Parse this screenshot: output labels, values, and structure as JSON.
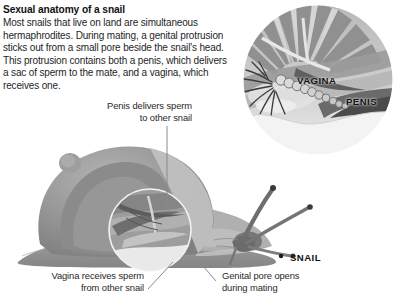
{
  "figure": {
    "title": "Sexual anatomy of a snail",
    "body": "Most snails that live on land are simultaneous hermaphrodites. During mating, a genital protrusion sticks out from a small pore beside the snail's head. This protrusion contains both a penis, which delivers a sac of sperm to the mate, and a vagina, which receives one."
  },
  "inset": {
    "name": "genital-protrusion-detail",
    "labels": {
      "vagina": "VAGINA",
      "penis": "PENIS"
    }
  },
  "main_illustration": {
    "organism_label": "SNAIL",
    "callouts": [
      {
        "name": "penis-callout",
        "text": "Penis delivers sperm\nto other snail"
      },
      {
        "name": "vagina-callout",
        "text": "Vagina receives sperm\nfrom other snail"
      },
      {
        "name": "genital-pore-callout",
        "text": "Genital pore opens\nduring mating"
      }
    ]
  },
  "palette": {
    "background": "#ffffff",
    "text": "#231f1f",
    "leader_line": "#6f6f6f",
    "shell_mid": "#9a9a9a",
    "shell_dark": "#7d7d7d",
    "shell_light": "#c2c2c2",
    "body_gray": "#a8a8a8",
    "foot_gray": "#8e8e8e",
    "inset_dark": "#8c8c8c",
    "inset_light": "#d8d8d8"
  }
}
